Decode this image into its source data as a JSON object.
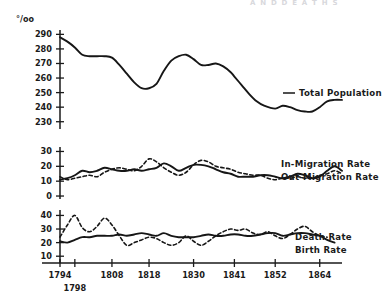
{
  "figure": {
    "faint_header_text": "A N D   D E A T H S",
    "unit_symbol": "°/oo"
  },
  "chart_data": [
    {
      "type": "line",
      "title": "Total Population",
      "xlabel": "",
      "ylabel": "°/oo",
      "grid": false,
      "legend_position": "right-inline",
      "xlim": [
        1794,
        1870
      ],
      "ylim": [
        225,
        293
      ],
      "yticks": [
        230,
        240,
        250,
        260,
        270,
        280,
        290
      ],
      "series": [
        {
          "name": "Total Population",
          "style": "solid",
          "x": [
            1794,
            1796,
            1798,
            1800,
            1802,
            1804,
            1806,
            1808,
            1810,
            1812,
            1814,
            1816,
            1818,
            1820,
            1822,
            1824,
            1826,
            1828,
            1830,
            1832,
            1834,
            1836,
            1838,
            1840,
            1841,
            1843,
            1845,
            1847,
            1849,
            1852,
            1854,
            1856,
            1858,
            1860,
            1862,
            1864,
            1866,
            1868,
            1870
          ],
          "values": [
            288,
            285,
            281,
            276,
            275,
            275,
            275,
            274,
            269,
            263,
            257,
            253,
            253,
            256,
            265,
            272,
            275,
            276,
            273,
            269,
            269,
            270,
            268,
            264,
            261,
            255,
            249,
            244,
            241,
            239,
            241,
            240,
            238,
            237,
            237,
            240,
            244,
            245,
            245
          ]
        }
      ]
    },
    {
      "type": "line",
      "title": "Migration Rates",
      "xlabel": "",
      "ylabel": "°/oo",
      "grid": false,
      "legend_position": "right-inline",
      "xlim": [
        1794,
        1870
      ],
      "ylim": [
        -2,
        33
      ],
      "yticks": [
        0,
        10,
        20,
        30
      ],
      "series": [
        {
          "name": "In-Migration Rate",
          "style": "solid",
          "x": [
            1794,
            1796,
            1798,
            1800,
            1802,
            1804,
            1806,
            1808,
            1810,
            1812,
            1814,
            1816,
            1818,
            1820,
            1822,
            1824,
            1826,
            1828,
            1830,
            1832,
            1834,
            1836,
            1838,
            1840,
            1842,
            1844,
            1846,
            1848,
            1850,
            1852,
            1854,
            1856,
            1858,
            1860,
            1862,
            1864,
            1866,
            1868,
            1870
          ],
          "values": [
            11,
            12,
            14,
            17,
            16,
            17,
            19,
            18,
            17,
            17,
            18,
            17,
            18,
            19,
            22,
            20,
            17,
            19,
            21,
            21,
            20,
            18,
            16,
            15,
            13,
            13,
            13,
            14,
            14,
            13,
            12,
            13,
            15,
            14,
            12,
            13,
            17,
            20,
            17
          ]
        },
        {
          "name": "Out-Migration Rate",
          "style": "dashed",
          "x": [
            1794,
            1796,
            1798,
            1800,
            1802,
            1804,
            1806,
            1808,
            1810,
            1812,
            1814,
            1816,
            1818,
            1820,
            1822,
            1824,
            1826,
            1828,
            1830,
            1832,
            1834,
            1836,
            1838,
            1840,
            1842,
            1844,
            1846,
            1848,
            1850,
            1852,
            1854,
            1856,
            1858,
            1860,
            1862,
            1864,
            1866,
            1868,
            1870
          ],
          "values": [
            13,
            11,
            12,
            13,
            14,
            13,
            16,
            18,
            19,
            18,
            17,
            20,
            25,
            23,
            19,
            16,
            14,
            16,
            21,
            24,
            23,
            20,
            19,
            18,
            16,
            15,
            14,
            14,
            12,
            11,
            12,
            12,
            13,
            12,
            12,
            14,
            15,
            17,
            15
          ]
        }
      ]
    },
    {
      "type": "line",
      "title": "Birth and Death Rates",
      "xlabel": "",
      "ylabel": "°/oo",
      "grid": false,
      "legend_position": "right-inline",
      "xlim": [
        1794,
        1870
      ],
      "ylim": [
        5,
        44
      ],
      "yticks": [
        10,
        20,
        30,
        40
      ],
      "series": [
        {
          "name": "Birth Rate",
          "style": "solid",
          "x": [
            1794,
            1796,
            1798,
            1800,
            1802,
            1804,
            1806,
            1808,
            1810,
            1812,
            1814,
            1816,
            1818,
            1820,
            1822,
            1824,
            1826,
            1828,
            1830,
            1832,
            1834,
            1836,
            1838,
            1840,
            1842,
            1844,
            1846,
            1848,
            1850,
            1852,
            1854,
            1856,
            1858,
            1860,
            1862,
            1864,
            1866,
            1868
          ],
          "values": [
            21,
            20,
            22,
            24,
            24,
            25,
            25,
            25,
            26,
            25,
            26,
            27,
            26,
            25,
            27,
            25,
            24,
            24,
            24,
            25,
            26,
            25,
            25,
            26,
            26,
            25,
            25,
            26,
            27,
            27,
            25,
            26,
            27,
            27,
            26,
            25,
            22,
            20
          ]
        },
        {
          "name": "Death Rate",
          "style": "dashed",
          "x": [
            1794,
            1796,
            1798,
            1800,
            1802,
            1804,
            1806,
            1808,
            1810,
            1812,
            1814,
            1816,
            1818,
            1820,
            1822,
            1824,
            1826,
            1828,
            1830,
            1832,
            1834,
            1836,
            1838,
            1840,
            1842,
            1844,
            1846,
            1848,
            1850,
            1852,
            1854,
            1856,
            1858,
            1860,
            1862,
            1864,
            1866
          ],
          "values": [
            24,
            33,
            40,
            31,
            28,
            32,
            38,
            33,
            25,
            18,
            20,
            22,
            24,
            23,
            20,
            18,
            20,
            25,
            21,
            18,
            21,
            25,
            28,
            30,
            29,
            30,
            27,
            26,
            28,
            25,
            23,
            26,
            30,
            32,
            28,
            25,
            24
          ]
        }
      ]
    }
  ],
  "x_axis": {
    "ticks": [
      {
        "year": 1794,
        "label": "1794",
        "row": 0
      },
      {
        "year": 1798,
        "label": "1798",
        "row": 1
      },
      {
        "year": 1808,
        "label": "1808",
        "row": 0
      },
      {
        "year": 1818,
        "label": "1818",
        "row": 0
      },
      {
        "year": 1830,
        "label": "1830",
        "row": 0
      },
      {
        "year": 1841,
        "label": "1841",
        "row": 0
      },
      {
        "year": 1852,
        "label": "1852",
        "row": 0
      },
      {
        "year": 1864,
        "label": "1864",
        "row": 0
      }
    ]
  },
  "panels": {
    "population": {
      "yticks": [
        "290",
        "280",
        "270",
        "260",
        "250",
        "240",
        "230"
      ],
      "label": "Total Population"
    },
    "migration": {
      "yticks": [
        "30",
        "20",
        "10",
        "0"
      ],
      "label_in": "In-Migration Rate",
      "label_out": "Out-Migration Rate"
    },
    "vital": {
      "yticks": [
        "40",
        "30",
        "20",
        "10"
      ],
      "label_death": "Death Rate",
      "label_birth": "Birth Rate"
    }
  }
}
